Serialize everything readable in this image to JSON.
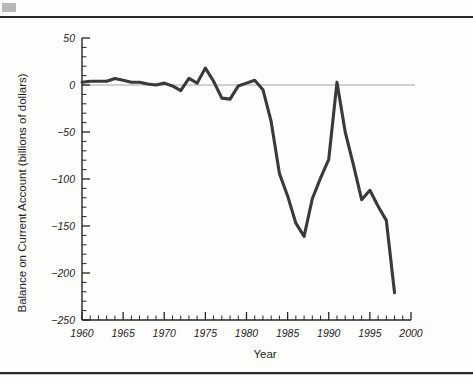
{
  "figure": {
    "background_color": "#fdfdfc",
    "line_color": "#3a3a3a",
    "axis_color": "#262626",
    "zero_line_color": "#9a9a9a",
    "rule_color": "#2b2b2b"
  },
  "chart_data": {
    "type": "line",
    "title": "",
    "xlabel": "Year",
    "ylabel": "Balance on Current Account (billions of dollars)",
    "xlim": [
      1960,
      2000
    ],
    "ylim": [
      -250,
      50
    ],
    "xticks": [
      1960,
      1965,
      1970,
      1975,
      1980,
      1985,
      1990,
      1995,
      2000
    ],
    "xtick_labels": [
      "1960",
      "1965",
      "1970",
      "1975",
      "1980",
      "1985",
      "1990",
      "1995",
      "2000"
    ],
    "yticks": [
      50,
      0,
      -50,
      -100,
      -150,
      -200,
      -250
    ],
    "ytick_labels": [
      "50",
      "0",
      "-50",
      "-100",
      "-150",
      "-200",
      "-250"
    ],
    "xtick_minor_step": 1,
    "ytick_minor_step": 10,
    "grid": false,
    "legend": false,
    "zero_reference_line": 0,
    "x": [
      1960,
      1961,
      1962,
      1963,
      1964,
      1965,
      1966,
      1967,
      1968,
      1969,
      1970,
      1971,
      1972,
      1973,
      1974,
      1975,
      1976,
      1977,
      1978,
      1979,
      1980,
      1981,
      1982,
      1983,
      1984,
      1985,
      1986,
      1987,
      1988,
      1989,
      1990,
      1991,
      1992,
      1993,
      1994,
      1995,
      1996,
      1997,
      1998
    ],
    "values": [
      3,
      4,
      4,
      4,
      7,
      5,
      3,
      3,
      1,
      0,
      2,
      -1,
      -6,
      7,
      2,
      18,
      4,
      -14,
      -15,
      -1,
      2,
      5,
      -5,
      -39,
      -94,
      -118,
      -147,
      -161,
      -121,
      -99,
      -79,
      3,
      -50,
      -85,
      -122,
      -112,
      -129,
      -144,
      -221
    ],
    "series_name": "U.S. Balance on Current Account",
    "annotations": []
  }
}
